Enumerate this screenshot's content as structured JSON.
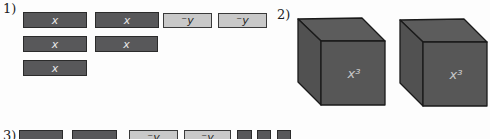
{
  "colors": {
    "background": "#fdfdfd",
    "tile_dark_fill": "#58585a",
    "tile_dark_border": "#2b2b2b",
    "tile_dark_text": "#e8e8e8",
    "tile_light_fill": "#c9c9c9",
    "tile_light_border": "#3a3a3a",
    "tile_light_text": "#252525",
    "cube_front_fill": "#575757",
    "cube_top_fill": "#5c5c5c",
    "cube_left_fill": "#515151",
    "cube_edge": "#1a1a1a",
    "cube_text": "#c8c8c8"
  },
  "problems": {
    "p1": {
      "label": "1)",
      "rows": [
        {
          "tiles": [
            {
              "type": "x",
              "label": "x"
            },
            {
              "type": "x",
              "label": "x"
            },
            {
              "type": "neg-y",
              "label": "⁻y"
            },
            {
              "type": "neg-y",
              "label": "⁻y"
            }
          ]
        },
        {
          "tiles": [
            {
              "type": "x",
              "label": "x"
            },
            {
              "type": "x",
              "label": "x"
            }
          ]
        },
        {
          "tiles": [
            {
              "type": "x",
              "label": "x"
            }
          ]
        }
      ]
    },
    "p2": {
      "label": "2)",
      "cubes": [
        {
          "label": "x³"
        },
        {
          "label": "x³"
        }
      ]
    },
    "p3": {
      "label": "3)",
      "tiles": [
        {
          "type": "x",
          "label": ""
        },
        {
          "type": "x",
          "label": ""
        },
        {
          "type": "neg-y",
          "label": "⁻y"
        },
        {
          "type": "neg-y",
          "label": "⁻y"
        },
        {
          "type": "unit",
          "label": ""
        },
        {
          "type": "unit",
          "label": ""
        },
        {
          "type": "unit",
          "label": ""
        }
      ]
    }
  }
}
